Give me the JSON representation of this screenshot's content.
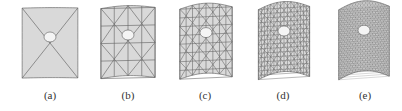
{
  "figure": {
    "panels": [
      {
        "id": "a",
        "label": "(a)",
        "subdivision": 1,
        "curvature": 0.05
      },
      {
        "id": "b",
        "label": "(b)",
        "subdivision": 2,
        "curvature": 0.3
      },
      {
        "id": "c",
        "label": "(c)",
        "subdivision": 4,
        "curvature": 0.6
      },
      {
        "id": "d",
        "label": "(d)",
        "subdivision": 8,
        "curvature": 0.8
      },
      {
        "id": "e",
        "label": "(e)",
        "subdivision": 16,
        "curvature": 0.9
      }
    ]
  }
}
